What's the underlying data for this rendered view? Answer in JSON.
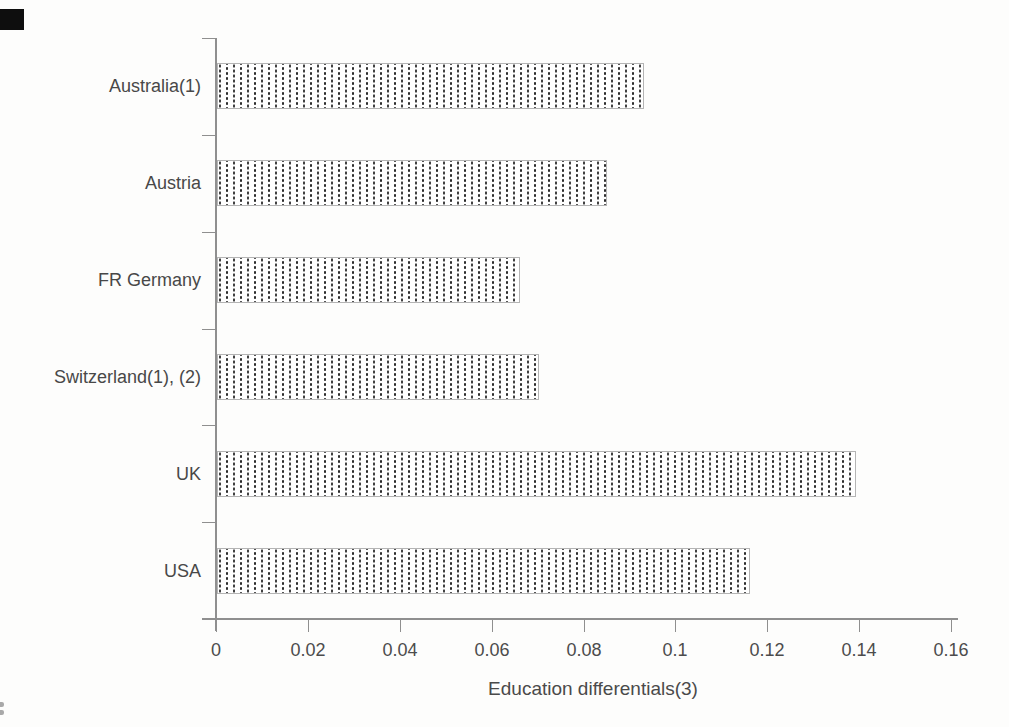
{
  "chart_data": {
    "type": "bar",
    "orientation": "horizontal",
    "title": "",
    "xlabel": "Education differentials(3)",
    "ylabel": "",
    "categories": [
      "Australia(1)",
      "Austria",
      "FR Germany",
      "Switzerland(1), (2)",
      "UK",
      "USA"
    ],
    "values": [
      0.093,
      0.085,
      0.066,
      0.07,
      0.139,
      0.116
    ],
    "xlim": [
      0,
      0.16
    ],
    "xtick_values": [
      0,
      0.02,
      0.04,
      0.06,
      0.08,
      0.1,
      0.12,
      0.14,
      0.16
    ],
    "xtick_labels": [
      "0",
      "0.02",
      "0.04",
      "0.06",
      "0.08",
      "0.1",
      "0.12",
      "0.14",
      "0.16"
    ],
    "grid": false,
    "legend": false,
    "bar_fill": "stippled-dot-pattern",
    "colors": {
      "bar_dot": "#2d2d2d",
      "bar_background": "#ffffff",
      "bar_border": "#b4b4b4",
      "axis": "#8f8f8f",
      "text": "#484848",
      "page_background": "#fdfdfc",
      "corner_mark": "#0e0e0e"
    }
  }
}
